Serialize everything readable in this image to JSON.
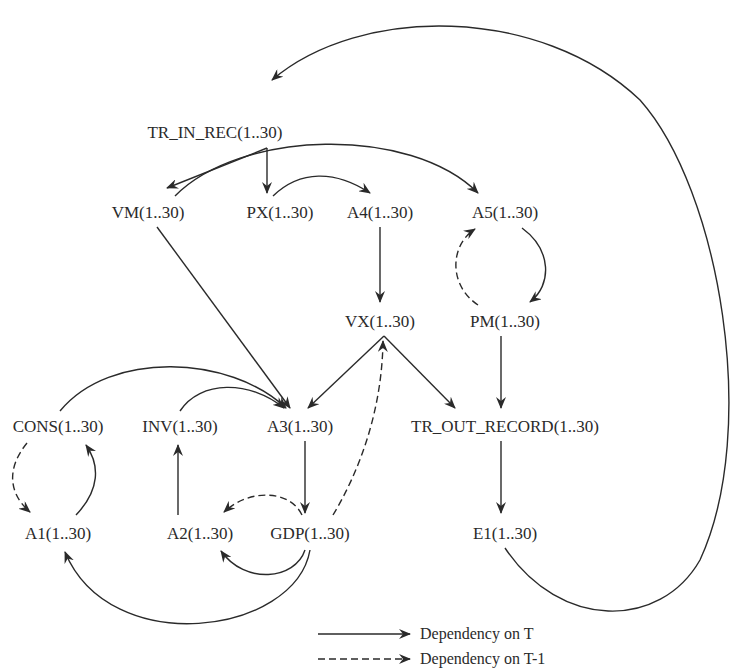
{
  "diagram": {
    "type": "dependency-graph",
    "nodes": [
      {
        "id": "tr_in_rec",
        "label": "TR_IN_REC(1..30)",
        "x": 215,
        "y": 132
      },
      {
        "id": "vm",
        "label": "VM(1..30)",
        "x": 148,
        "y": 212
      },
      {
        "id": "px",
        "label": "PX(1..30)",
        "x": 280,
        "y": 212
      },
      {
        "id": "a4",
        "label": "A4(1..30)",
        "x": 380,
        "y": 212
      },
      {
        "id": "a5",
        "label": "A5(1..30)",
        "x": 505,
        "y": 212
      },
      {
        "id": "vx",
        "label": "VX(1..30)",
        "x": 380,
        "y": 321
      },
      {
        "id": "pm",
        "label": "PM(1..30)",
        "x": 505,
        "y": 321
      },
      {
        "id": "cons",
        "label": "CONS(1..30)",
        "x": 58,
        "y": 426
      },
      {
        "id": "inv",
        "label": "INV(1..30)",
        "x": 180,
        "y": 426
      },
      {
        "id": "a3",
        "label": "A3(1..30)",
        "x": 300,
        "y": 426
      },
      {
        "id": "tr_out_record",
        "label": "TR_OUT_RECORD(1..30)",
        "x": 505,
        "y": 426
      },
      {
        "id": "a1",
        "label": "A1(1..30)",
        "x": 58,
        "y": 533
      },
      {
        "id": "a2",
        "label": "A2(1..30)",
        "x": 200,
        "y": 533
      },
      {
        "id": "gdp",
        "label": "GDP(1..30)",
        "x": 310,
        "y": 533
      },
      {
        "id": "e1",
        "label": "E1(1..30)",
        "x": 505,
        "y": 533
      }
    ],
    "edges": [
      {
        "from": "tr_in_rec",
        "to": "vm",
        "kind": "T"
      },
      {
        "from": "tr_in_rec",
        "to": "px",
        "kind": "T"
      },
      {
        "from": "vm",
        "to": "a5",
        "kind": "T"
      },
      {
        "from": "px",
        "to": "a4",
        "kind": "T"
      },
      {
        "from": "a4",
        "to": "vx",
        "kind": "T"
      },
      {
        "from": "a5",
        "to": "pm",
        "kind": "T"
      },
      {
        "from": "pm",
        "to": "a5",
        "kind": "T-1"
      },
      {
        "from": "vm",
        "to": "a3",
        "kind": "T"
      },
      {
        "from": "cons",
        "to": "a3",
        "kind": "T"
      },
      {
        "from": "inv",
        "to": "a3",
        "kind": "T"
      },
      {
        "from": "vx",
        "to": "a3",
        "kind": "T"
      },
      {
        "from": "vx",
        "to": "tr_out_record",
        "kind": "T"
      },
      {
        "from": "pm",
        "to": "tr_out_record",
        "kind": "T"
      },
      {
        "from": "tr_out_record",
        "to": "e1",
        "kind": "T"
      },
      {
        "from": "e1",
        "to": "tr_in_rec",
        "kind": "T"
      },
      {
        "from": "cons",
        "to": "a1",
        "kind": "T-1"
      },
      {
        "from": "a1",
        "to": "cons",
        "kind": "T"
      },
      {
        "from": "a2",
        "to": "inv",
        "kind": "T"
      },
      {
        "from": "a3",
        "to": "gdp",
        "kind": "T"
      },
      {
        "from": "gdp",
        "to": "a2",
        "kind": "T-1"
      },
      {
        "from": "gdp",
        "to": "a2",
        "kind": "T"
      },
      {
        "from": "gdp",
        "to": "a1",
        "kind": "T"
      },
      {
        "from": "gdp",
        "to": "vx",
        "kind": "T-1"
      }
    ]
  },
  "legend": {
    "items": [
      {
        "style": "solid",
        "label": "Dependency on T"
      },
      {
        "style": "dashed",
        "label": "Dependency on T-1"
      }
    ]
  }
}
